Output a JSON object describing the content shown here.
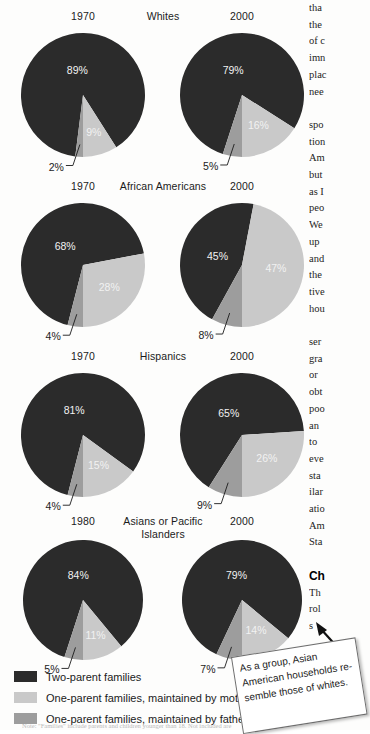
{
  "chart_data": {
    "type": "pie",
    "legend": [
      {
        "key": "two_parent",
        "label": "Two-parent families",
        "color": "#2b2b2b"
      },
      {
        "key": "mother",
        "label": "One-parent families, maintained by mother",
        "color": "#c9c9c9"
      },
      {
        "key": "father",
        "label": "One-parent families, maintained by father",
        "color": "#9d9d9d"
      }
    ],
    "categories": [
      "Two-parent families",
      "One-parent families, maintained by mother",
      "One-parent families, maintained by father"
    ],
    "groups": [
      {
        "name": "Whites",
        "charts": [
          {
            "year": "1970",
            "values": [
              89,
              9,
              2
            ],
            "labels": [
              "89%",
              "9%",
              "2%"
            ]
          },
          {
            "year": "2000",
            "values": [
              79,
              16,
              5
            ],
            "labels": [
              "79%",
              "16%",
              "5%"
            ]
          }
        ]
      },
      {
        "name": "African Americans",
        "charts": [
          {
            "year": "1970",
            "values": [
              68,
              28,
              4
            ],
            "labels": [
              "68%",
              "28%",
              "4%"
            ]
          },
          {
            "year": "2000",
            "values": [
              45,
              47,
              8
            ],
            "labels": [
              "45%",
              "47%",
              "8%"
            ]
          }
        ]
      },
      {
        "name": "Hispanics",
        "charts": [
          {
            "year": "1970",
            "values": [
              81,
              15,
              4
            ],
            "labels": [
              "81%",
              "15%",
              "4%"
            ]
          },
          {
            "year": "2000",
            "values": [
              65,
              26,
              9
            ],
            "labels": [
              "65%",
              "26%",
              "9%"
            ]
          }
        ]
      },
      {
        "name": "Asians or Pacific Islanders",
        "charts": [
          {
            "year": "1980",
            "values": [
              84,
              11,
              5
            ],
            "labels": [
              "84%",
              "11%",
              "5%"
            ]
          },
          {
            "year": "2000",
            "values": [
              79,
              14,
              7
            ],
            "labels": [
              "79%",
              "14%",
              "7%"
            ]
          }
        ]
      }
    ]
  },
  "callout": {
    "text": "As a group, Asian American households re-semble those of whites."
  },
  "footnote": {
    "text": "Note: \"Families\" include parents and children younger than 18. Not included are"
  },
  "body_column": {
    "paragraph1": [
      "tha",
      "the",
      "of c",
      "imn",
      "plac",
      "nee"
    ],
    "paragraph2": [
      "spo",
      "tion",
      "Am",
      "but",
      "as I",
      "peo",
      "We",
      "up",
      "and",
      "the",
      "tive",
      "hou"
    ],
    "paragraph3": [
      "ser",
      "gra",
      "or ",
      "obt",
      "poo",
      "an ",
      "to ",
      "eve",
      "sta",
      "ilar",
      "atio",
      "Am",
      "Sta"
    ],
    "heading": "Ch",
    "paragraph4": [
      "Th",
      "rol",
      "s"
    ]
  }
}
